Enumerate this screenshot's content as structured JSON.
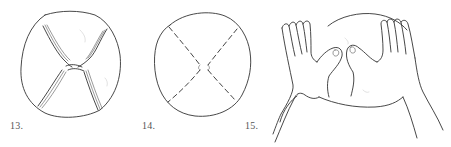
{
  "figures": [
    {
      "number": "13.",
      "description": "Round dough with four pinched seams meeting at the center"
    },
    {
      "number": "14.",
      "description": "Round dough with dashed fold lines forming an X"
    },
    {
      "number": "15.",
      "description": "Two hands shaping round dough with thumbs pressing in"
    }
  ],
  "colors": {
    "line": "#333333",
    "label": "#555555",
    "background": "#ffffff"
  }
}
